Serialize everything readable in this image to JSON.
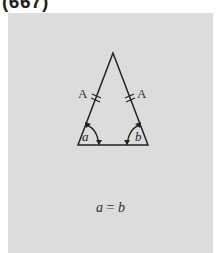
{
  "header": {
    "label": "(667)"
  },
  "figure": {
    "type": "isosceles-triangle",
    "panel_color": "#dcdcdc",
    "line_color": "#222222",
    "sides": [
      {
        "label": "A",
        "tick_marks": 2
      },
      {
        "label": "A",
        "tick_marks": 2
      }
    ],
    "angles": [
      {
        "label": "a"
      },
      {
        "label": "b"
      }
    ]
  },
  "equation": {
    "left": "a",
    "operator": "=",
    "right": "b"
  }
}
